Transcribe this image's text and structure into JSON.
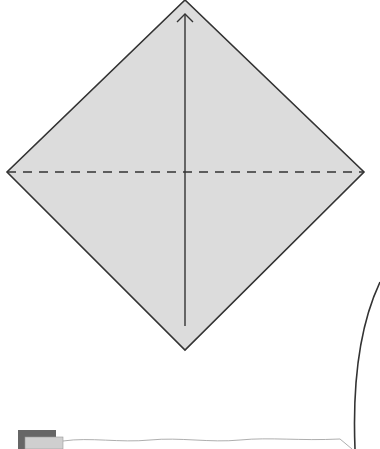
{
  "diagram": {
    "type": "origami-fold-instruction",
    "paper_color": "#dcdcdc",
    "line_color": "#333333",
    "fold_lines": [
      {
        "kind": "valley-fold",
        "orientation": "horizontal",
        "style": "dashed"
      }
    ],
    "arrows": [
      {
        "kind": "fold-direction-arrow",
        "direction": "up"
      }
    ],
    "next_step_preview": {
      "colors": {
        "back": "#666666",
        "front": "#cfcfcf"
      }
    }
  }
}
